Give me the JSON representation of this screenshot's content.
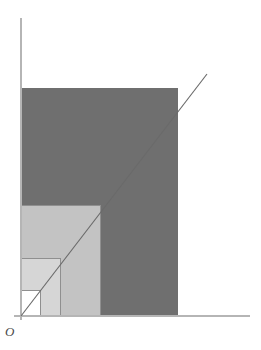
{
  "figure": {
    "background_color": "#ffffff",
    "width": 261,
    "height": 350,
    "origin_label": "O"
  },
  "axes": {
    "origin": {
      "x": 21,
      "y": 316
    },
    "y_axis": {
      "x": 21,
      "y_top": 18,
      "y_bottom": 320,
      "color": "#b5b5b5"
    },
    "x_axis": {
      "y": 316,
      "x_left": 14,
      "x_right": 250,
      "color": "#b5b5b5"
    },
    "show_ticks": false,
    "show_grid": false,
    "tick_labels_x": [],
    "tick_labels_y": []
  },
  "line": {
    "name": "diagonal",
    "equation_label": "y = x",
    "color": "#6a6a6a",
    "start": {
      "x": 21,
      "y": 316
    },
    "end": {
      "x": 207,
      "y": 74
    },
    "corner_touch": {
      "x": 178,
      "y": 88
    }
  },
  "regions": [
    {
      "name": "outer-dark-block",
      "shade_label": "dark-gray",
      "color": "#6f6f6f",
      "x": 21,
      "y": 88,
      "width": 157,
      "height": 228
    },
    {
      "name": "mid-light-block",
      "shade_label": "light-gray",
      "color": "#c3c3c3",
      "x": 21,
      "y": 205,
      "width": 79,
      "height": 111
    },
    {
      "name": "inner-lighter-block",
      "shade_label": "lighter-gray",
      "color": "#d6d6d6",
      "x": 21,
      "y": 258,
      "width": 39,
      "height": 58
    },
    {
      "name": "innermost-white-block",
      "shade_label": "white",
      "color": "#ffffff",
      "x": 21,
      "y": 290,
      "width": 19,
      "height": 26
    }
  ],
  "step_edges": [
    {
      "name": "step-edge-1",
      "x1": 40,
      "y1": 290,
      "x2": 40,
      "y2": 316
    },
    {
      "name": "step-edge-2",
      "x1": 60,
      "y1": 258,
      "x2": 60,
      "y2": 316
    },
    {
      "name": "step-edge-3",
      "x1": 100,
      "y1": 205,
      "x2": 100,
      "y2": 316
    },
    {
      "name": "step-edge-4",
      "x1": 21,
      "y1": 290,
      "x2": 40,
      "y2": 290
    },
    {
      "name": "step-edge-5",
      "x1": 21,
      "y1": 258,
      "x2": 60,
      "y2": 258
    },
    {
      "name": "step-edge-6",
      "x1": 21,
      "y1": 205,
      "x2": 100,
      "y2": 205
    }
  ],
  "chart_data": {
    "type": "area",
    "xlabel": "",
    "ylabel": "",
    "xlim": [
      0,
      10
    ],
    "ylim": [
      0,
      13
    ],
    "grid": false,
    "legend": "none",
    "annotations": [
      "O"
    ],
    "series": [
      {
        "name": "diagonal line y = x",
        "kind": "line",
        "x": [
          0,
          10
        ],
        "y": [
          0,
          13
        ]
      },
      {
        "name": "nested step rectangles",
        "kind": "bar",
        "categories": [
          "innermost",
          "inner",
          "mid",
          "outer"
        ],
        "widths": [
          1,
          2,
          4,
          8
        ],
        "heights": [
          1.5,
          3.3,
          6.3,
          13.0
        ],
        "shades": [
          "#ffffff",
          "#d6d6d6",
          "#c3c3c3",
          "#6f6f6f"
        ]
      }
    ]
  }
}
